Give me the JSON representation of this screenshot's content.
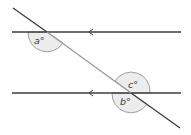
{
  "diagram": {
    "type": "parallel-lines-transversal",
    "colors": {
      "parallel_line": "#3c3c3c",
      "transversal": "#3c3c3c",
      "overlap": "#9a9a9a",
      "angle_fill": "#ececec",
      "angle_stroke": "#8c8c8c",
      "text": "#3a3a3a"
    },
    "labels": {
      "a": "a°",
      "b": "b°",
      "c": "c°"
    },
    "arrow_direction": "left"
  }
}
